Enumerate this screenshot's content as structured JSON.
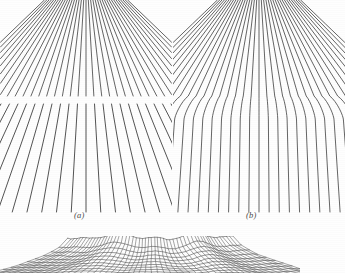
{
  "figure": {
    "background_color": "#fefefe",
    "ink_color": "#3a3a3a",
    "panels": [
      {
        "id": "a",
        "caption": "(a)",
        "kind": "perspective-line-field",
        "description": "converging straight lines with horizontal discontinuity band",
        "line_count": 37,
        "vanishing_point_x_frac": 0.5,
        "vanishing_point_y": -40,
        "break_y": 96,
        "break_gap": 8,
        "bottom_y": 212,
        "width": 172,
        "height": 215
      },
      {
        "id": "b",
        "caption": "(b)",
        "kind": "perspective-line-field-bent",
        "description": "converging lines bent outward at a curved discontinuity",
        "line_count": 37,
        "vanishing_point_x_frac": 0.5,
        "vanishing_point_y": -40,
        "bend_y": 96,
        "bottom_y": 212,
        "width": 172,
        "height": 215
      },
      {
        "id": "c",
        "caption": "",
        "kind": "distorted-perspective-mesh",
        "description": "partial cropped wireframe mesh surface with folds",
        "rows": 11,
        "cols": 54,
        "width": 300,
        "height": 37
      }
    ]
  },
  "captions": {
    "a": "(a)",
    "b": "(b)"
  }
}
